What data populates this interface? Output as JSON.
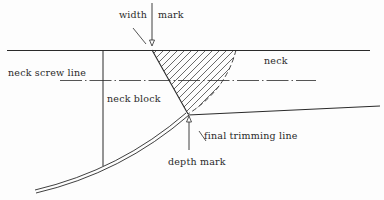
{
  "labels": {
    "width_mark_left": "width",
    "width_mark_right": "mark",
    "neck": "neck",
    "neck_screw_line": "neck screw line",
    "neck_block": "neck block",
    "final_trimming_line": "final trimming line",
    "depth_mark": "depth mark"
  },
  "colors": {
    "ink": "#2a2a2a",
    "background": "#fdfdfd"
  }
}
